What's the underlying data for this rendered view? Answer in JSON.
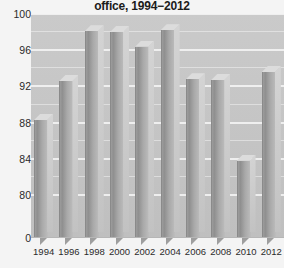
{
  "chart_data": {
    "type": "bar",
    "title": "office, 1994−2012",
    "xlabel": "",
    "ylabel": "",
    "categories": [
      "1994",
      "1996",
      "1998",
      "2000",
      "2002",
      "2004",
      "2006",
      "2008",
      "2010",
      "2012"
    ],
    "values": [
      88.3,
      92.6,
      98.1,
      98.0,
      96.4,
      98.2,
      92.8,
      92.7,
      83.8,
      93.6
    ],
    "ylim": [
      80,
      100
    ],
    "y_axis_broken": true,
    "y_ticks": [
      "100",
      "96",
      "92",
      "88",
      "84",
      "80",
      "0"
    ],
    "y_tick_values": [
      100,
      96,
      92,
      88,
      84,
      80,
      0
    ],
    "grid": true,
    "legend": "none",
    "style": "3d-bar-grayscale",
    "series": [
      {
        "name": "office",
        "values": [
          88.3,
          92.6,
          98.1,
          98.0,
          96.4,
          98.2,
          92.8,
          92.7,
          83.8,
          93.6
        ]
      }
    ]
  },
  "colors": {
    "plot_background": "#c8c8c8",
    "gridline": "#f2f2f2",
    "bar_front": "#9c9c9c",
    "bar_side": "#cccccc",
    "bar_top": "#dcdcdc",
    "title_text": "#1b1b1b",
    "tick_text": "#2a2a2a",
    "page_background": "#f4f4f4"
  }
}
